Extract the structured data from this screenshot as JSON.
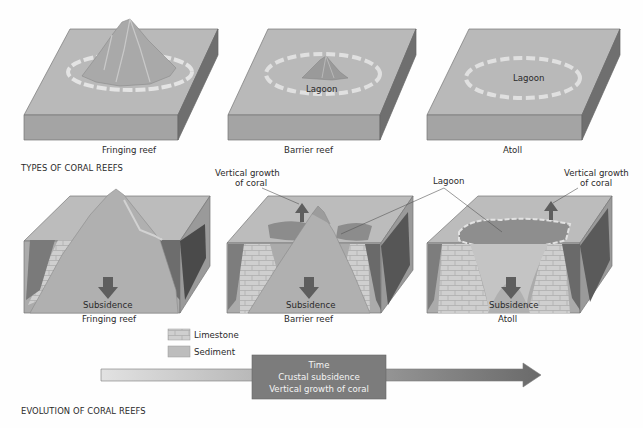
{
  "colors": {
    "top_surface": "#b8b8b8",
    "front_face": "#a2a2a2",
    "side_face": "#6e6e6e",
    "reef_ring": "#dcdcdc",
    "lagoon": "#8c8c8c",
    "limestone": "#c8c8c8",
    "sediment": "#bdbdbd",
    "arrow_dark": "#5e5e5e",
    "time_box": "#7c7c7c"
  },
  "types": {
    "title": "TYPES OF CORAL REEFS",
    "blocks": [
      {
        "caption": "Fringing reef",
        "inner_label": ""
      },
      {
        "caption": "Barrier reef",
        "inner_label": "Lagoon"
      },
      {
        "caption": "Atoll",
        "inner_label": "Lagoon"
      }
    ]
  },
  "evolution": {
    "title": "EVOLUTION OF CORAL REEFS",
    "blocks": [
      {
        "caption": "Fringing reef",
        "subsidence": "Subsidence"
      },
      {
        "caption": "Barrier reef",
        "subsidence": "Subsidence"
      },
      {
        "caption": "Atoll",
        "subsidence": "Subsidence"
      }
    ],
    "callouts": {
      "vertical_growth_left_1": "Vertical growth",
      "vertical_growth_left_2": "of coral",
      "lagoon": "Lagoon",
      "vertical_growth_right_1": "Vertical growth",
      "vertical_growth_right_2": "of coral"
    },
    "legend": [
      {
        "label": "Limestone"
      },
      {
        "label": "Sediment"
      }
    ],
    "timeline": {
      "line1": "Time",
      "line2": "Crustal subsidence",
      "line3": "Vertical growth of coral"
    }
  }
}
